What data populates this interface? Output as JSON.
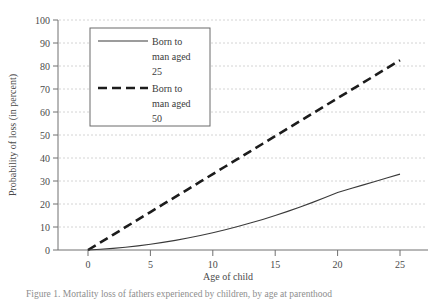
{
  "chart_data": {
    "type": "line",
    "title": "",
    "xlabel": "Age of child",
    "ylabel": "Probability of loss (in percent)",
    "xlim": [
      0,
      27
    ],
    "ylim": [
      0,
      100
    ],
    "xticks": [
      0,
      5,
      10,
      15,
      20,
      25
    ],
    "yticks": [
      0,
      10,
      20,
      30,
      40,
      50,
      60,
      70,
      80,
      90,
      100
    ],
    "xtick_labels": [
      "0",
      "5",
      "10",
      "15",
      "20",
      "25"
    ],
    "ytick_labels": [
      "0",
      "10",
      "20",
      "30",
      "40",
      "50",
      "60",
      "70",
      "80",
      "90",
      "100"
    ],
    "grid": "horizontal-dashed",
    "legend_position": "upper-left-inside",
    "series": [
      {
        "name": "Born to man aged 25",
        "style": "solid",
        "color": "#3a3a3a",
        "x": [
          0,
          1,
          2,
          3,
          4,
          5,
          6,
          7,
          8,
          9,
          10,
          11,
          12,
          13,
          14,
          15,
          16,
          17,
          18,
          19,
          20,
          21,
          22,
          23,
          24,
          25
        ],
        "values": [
          0,
          0.3,
          0.7,
          1.2,
          1.8,
          2.5,
          3.3,
          4.2,
          5.2,
          6.3,
          7.5,
          8.8,
          10.2,
          11.7,
          13.3,
          15.0,
          16.8,
          18.7,
          20.7,
          22.8,
          25.0,
          26.6,
          28.2,
          29.8,
          31.4,
          33.0
        ]
      },
      {
        "name": "Born to man aged 50",
        "style": "dashed",
        "color": "#1c1c1c",
        "x": [
          0,
          1,
          2,
          3,
          4,
          5,
          6,
          7,
          8,
          9,
          10,
          11,
          12,
          13,
          14,
          15,
          16,
          17,
          18,
          19,
          20,
          21,
          22,
          23,
          24,
          25
        ],
        "values": [
          0,
          3.3,
          6.6,
          9.9,
          13.2,
          16.5,
          19.8,
          23.1,
          26.4,
          29.7,
          33.0,
          36.3,
          39.6,
          42.9,
          46.2,
          49.5,
          52.8,
          56.1,
          59.4,
          62.7,
          66.0,
          69.3,
          72.6,
          75.9,
          79.2,
          82.5
        ]
      }
    ]
  },
  "legend": {
    "entries": [
      {
        "label_line1": "Born to",
        "label_line2": "man aged",
        "label_line3": "25"
      },
      {
        "label_line1": "Born to",
        "label_line2": "man aged",
        "label_line3": "50"
      }
    ]
  },
  "caption": {
    "text": "Figure 1. Mortality loss of fathers experienced by children, by age at parenthood"
  }
}
